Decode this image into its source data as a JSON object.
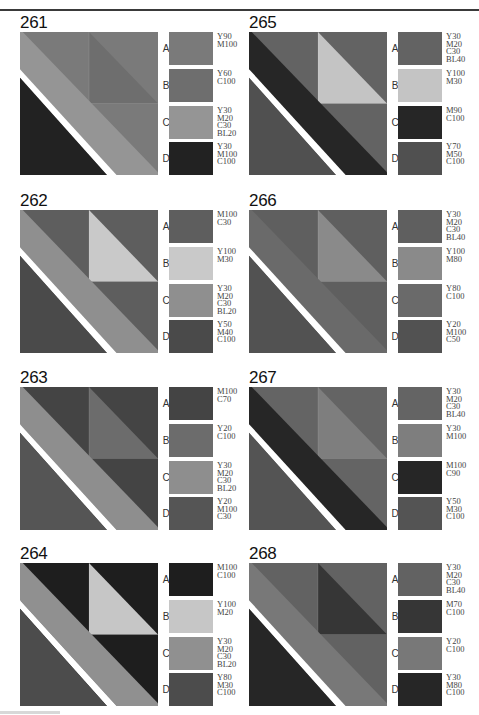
{
  "page": {
    "panels": [
      {
        "id": "261",
        "colors": {
          "A": "#7a7a7a",
          "B": "#6e6e6e",
          "C": "#959595",
          "D": "#222222"
        },
        "swatches": [
          {
            "letter": "A",
            "code": "Y90\nM100"
          },
          {
            "letter": "B",
            "code": "Y60\nC100"
          },
          {
            "letter": "C",
            "code": "Y30\nM20\nC30\nBL20"
          },
          {
            "letter": "D",
            "code": "Y30\nM100\nC100"
          }
        ]
      },
      {
        "id": "262",
        "colors": {
          "A": "#5e5e5e",
          "B": "#c9c9c9",
          "C": "#8f8f8f",
          "D": "#4a4a4a"
        },
        "swatches": [
          {
            "letter": "A",
            "code": "M100\nC30"
          },
          {
            "letter": "B",
            "code": "Y100\nM30"
          },
          {
            "letter": "C",
            "code": "Y30\nM20\nC30\nBL20"
          },
          {
            "letter": "D",
            "code": "Y50\nM40\nC100"
          }
        ]
      },
      {
        "id": "263",
        "colors": {
          "A": "#444444",
          "B": "#6c6c6c",
          "C": "#8e8e8e",
          "D": "#555555"
        },
        "swatches": [
          {
            "letter": "A",
            "code": "M100\nC70"
          },
          {
            "letter": "B",
            "code": "Y20\nC100"
          },
          {
            "letter": "C",
            "code": "Y30\nM20\nC30\nBL20"
          },
          {
            "letter": "D",
            "code": "Y20\nM100\nC30"
          }
        ]
      },
      {
        "id": "264",
        "colors": {
          "A": "#1e1e1e",
          "B": "#c6c6c6",
          "C": "#909090",
          "D": "#4c4c4c"
        },
        "swatches": [
          {
            "letter": "A",
            "code": "M100\nC100"
          },
          {
            "letter": "B",
            "code": "Y100\nM20"
          },
          {
            "letter": "C",
            "code": "Y30\nM20\nC30\nBL20"
          },
          {
            "letter": "D",
            "code": "Y80\nM30\nC100"
          }
        ]
      },
      {
        "id": "265",
        "colors": {
          "A": "#636363",
          "B": "#c4c4c4",
          "C": "#262626",
          "D": "#505050"
        },
        "swatches": [
          {
            "letter": "A",
            "code": "Y30\nM20\nC30\nBL40"
          },
          {
            "letter": "B",
            "code": "Y100\nM30"
          },
          {
            "letter": "C",
            "code": "M90\nC100"
          },
          {
            "letter": "D",
            "code": "Y70\nM50\nC100"
          }
        ]
      },
      {
        "id": "266",
        "colors": {
          "A": "#5f5f5f",
          "B": "#8a8a8a",
          "C": "#6a6a6a",
          "D": "#525252"
        },
        "swatches": [
          {
            "letter": "A",
            "code": "Y30\nM20\nC30\nBL40"
          },
          {
            "letter": "B",
            "code": "Y100\nM80"
          },
          {
            "letter": "C",
            "code": "Y80\nC100"
          },
          {
            "letter": "D",
            "code": "Y20\nM100\nC50"
          }
        ]
      },
      {
        "id": "267",
        "colors": {
          "A": "#646464",
          "B": "#7e7e7e",
          "C": "#262626",
          "D": "#545454"
        },
        "swatches": [
          {
            "letter": "A",
            "code": "Y30\nM20\nC30\nBL40"
          },
          {
            "letter": "B",
            "code": "Y30\nM100"
          },
          {
            "letter": "C",
            "code": "M100\nC90"
          },
          {
            "letter": "D",
            "code": "Y50\nM30\nC100"
          }
        ]
      },
      {
        "id": "268",
        "colors": {
          "A": "#626262",
          "B": "#363636",
          "C": "#787878",
          "D": "#262626"
        },
        "swatches": [
          {
            "letter": "A",
            "code": "Y30\nM20\nC30\nBL40"
          },
          {
            "letter": "B",
            "code": "M70\nC100"
          },
          {
            "letter": "C",
            "code": "Y20\nC100"
          },
          {
            "letter": "D",
            "code": "Y30\nM80\nC100"
          }
        ]
      }
    ]
  }
}
